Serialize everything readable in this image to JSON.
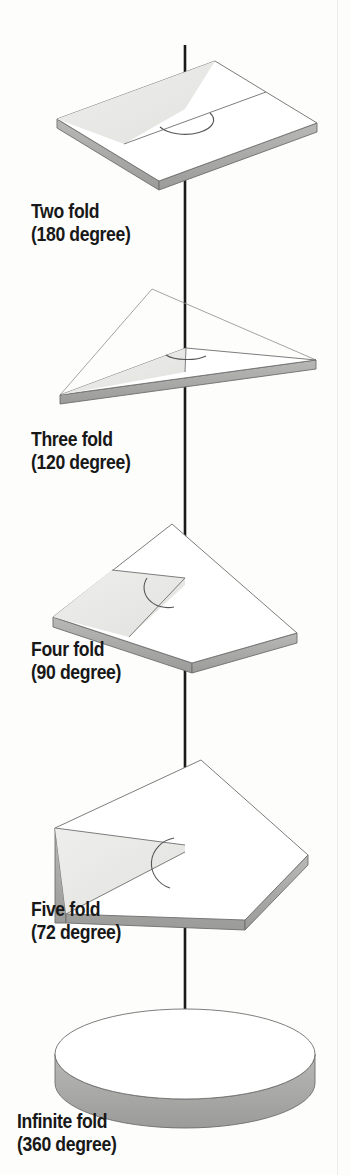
{
  "figure": {
    "background_color": "#fdfdfc",
    "axis_color": "#1a1a1a",
    "outline_color": "#6e6e6e",
    "top_face_color": "#ffffff",
    "sector_fill_color": "#e8e8e6",
    "edge_side_color": "#a9a9a9",
    "edge_front_color": "#bdbdbd",
    "axis_label": "rotation-axis",
    "items": [
      {
        "id": "two-fold",
        "shape": "rectangle",
        "sides": 2,
        "fold": "Two fold",
        "angle_text": "(180 degree)",
        "angle_degrees": 180,
        "label_line1": "Two fold",
        "label_line2": "(180 degree)"
      },
      {
        "id": "three-fold",
        "shape": "triangle",
        "sides": 3,
        "fold": "Three fold",
        "angle_text": "(120 degree)",
        "angle_degrees": 120,
        "label_line1": "Three fold",
        "label_line2": "(120 degree)"
      },
      {
        "id": "four-fold",
        "shape": "square",
        "sides": 4,
        "fold": "Four fold",
        "angle_text": "(90 degree)",
        "angle_degrees": 90,
        "label_line1": "Four fold",
        "label_line2": "(90 degree)"
      },
      {
        "id": "five-fold",
        "shape": "pentagon",
        "sides": 5,
        "fold": "Five fold",
        "angle_text": "(72 degree)",
        "angle_degrees": 72,
        "label_line1": "Five fold",
        "label_line2": "(72 degree)"
      },
      {
        "id": "infinite-fold",
        "shape": "circle",
        "sides": 0,
        "fold": "Infinite fold",
        "angle_text": "(360 degree)",
        "angle_degrees": 360,
        "label_line1": "Infinite fold",
        "label_line2": "(360 degree)"
      }
    ]
  }
}
